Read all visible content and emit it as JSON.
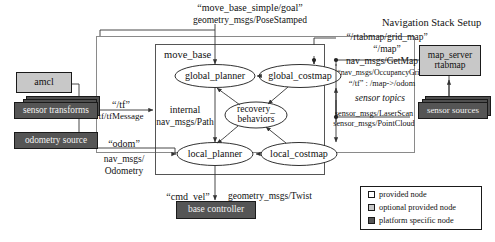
{
  "title": "Navigation Stack Setup",
  "colors": {
    "provided_node": "#ffffff",
    "optional_provided_node": "#c8c8c8",
    "platform_specific_node": "#555555",
    "stroke": "#1a1a1a",
    "background": "#ffffff"
  },
  "container": {
    "move_base_label": "move_base"
  },
  "internal_label": {
    "line1": "internal",
    "line2": "nav_msgs/Path"
  },
  "nodes": {
    "global_planner": "global_planner",
    "global_costmap": "global_costmap",
    "recovery_behaviors_line1": "recovery_",
    "recovery_behaviors_line2": "behaviors",
    "local_planner": "local_planner",
    "local_costmap": "local_costmap"
  },
  "external_nodes": [
    {
      "id": "amcl",
      "label": "amcl",
      "type": "optional provided node"
    },
    {
      "id": "sensor-transforms",
      "label": "sensor transforms",
      "type": "platform specific node"
    },
    {
      "id": "odometry-source",
      "label": "odometry source",
      "type": "platform specific node"
    },
    {
      "id": "base-controller",
      "label": "base controller",
      "type": "platform specific node"
    },
    {
      "id": "map-server",
      "label_line1": "map_server",
      "label_line2": "rtabmap",
      "type": "optional provided node"
    },
    {
      "id": "sensor-sources",
      "label": "sensor sources",
      "type": "platform specific node"
    }
  ],
  "topics": {
    "goal_topic": "“move_base_simple/goal”",
    "goal_type": "geometry_msgs/PoseStamped",
    "tf_topic": "“/tf”",
    "tf_type": "tf/tfMessage",
    "odom_topic": "“odom”",
    "odom_type_line1": "nav_msgs/",
    "odom_type_line2": "Odometry",
    "cmd_vel_topic": "“cmd_vel”",
    "cmd_vel_type": "geometry_msgs/Twist",
    "grid_map_topic": "“/rtabmap/grid_map”",
    "map_topic": "“/map”",
    "map_type": "nav_msgs/GetMap",
    "occupancy_type": "“nav_msgs/OccupancyGrid”",
    "tf_map_odom": "“/tf” : /map->/odom",
    "sensor_topics_label": "sensor topics",
    "laserscan_type": "sensor_msgs/LaserScan",
    "pointcloud_type": "sensor_msgs/PointCloud"
  },
  "legend": [
    {
      "label": "provided node",
      "swatch": "sw-provided"
    },
    {
      "label": "optional provided node",
      "swatch": "sw-optional"
    },
    {
      "label": "platform specific node",
      "swatch": "sw-platform"
    }
  ]
}
